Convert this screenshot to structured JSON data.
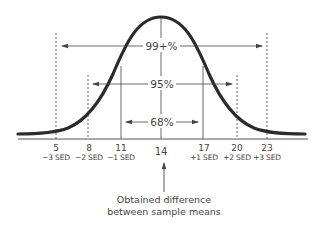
{
  "diagram": {
    "percent_labels": {
      "p99": "99+%",
      "p95": "95%",
      "p68": "68%"
    },
    "axis": {
      "mean_value": "14",
      "ticks": [
        {
          "value": "5",
          "sed": "−3 SED"
        },
        {
          "value": "8",
          "sed": "−2 SED"
        },
        {
          "value": "11",
          "sed": "−1 SED"
        },
        {
          "value": "17",
          "sed": "+1 SED"
        },
        {
          "value": "20",
          "sed": "+2 SED"
        },
        {
          "value": "23",
          "sed": "+3 SED"
        }
      ]
    },
    "caption": {
      "line1": "Obtained difference",
      "line2": "between sample means"
    },
    "colors": {
      "curve": "#2b2b2b",
      "lines": "#555555",
      "text": "#444444"
    }
  }
}
